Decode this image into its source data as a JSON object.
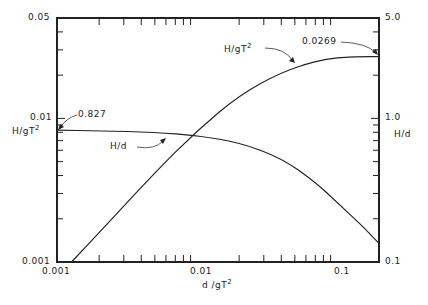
{
  "chart_data": {
    "type": "line",
    "title": "",
    "xlabel": "d/gT²",
    "ylabel_left": "H/gT²",
    "ylabel_right": "H/d",
    "xscale": "log",
    "yscale_left": "log",
    "yscale_right": "log",
    "xlim": [
      0.001,
      0.2
    ],
    "ylim_left": [
      0.001,
      0.05
    ],
    "ylim_right": [
      0.1,
      5.0
    ],
    "x_ticks": [
      "0.001",
      "0.01",
      "0.1"
    ],
    "y_left_ticks": [
      "0.001",
      "0.01",
      "0.05"
    ],
    "y_right_ticks": [
      "0.1",
      "1.0",
      "5.0"
    ],
    "grid": false,
    "series": [
      {
        "name": "H/gT²",
        "axis": "left",
        "x": [
          0.00127,
          0.002,
          0.005,
          0.01,
          0.02,
          0.04,
          0.07,
          0.1,
          0.15,
          0.2
        ],
        "y": [
          0.001,
          0.0016,
          0.0042,
          0.0082,
          0.0145,
          0.021,
          0.025,
          0.0265,
          0.0269,
          0.0269
        ]
      },
      {
        "name": "H/d",
        "axis": "right",
        "x": [
          0.001,
          0.002,
          0.005,
          0.01,
          0.02,
          0.04,
          0.07,
          0.1,
          0.15,
          0.2
        ],
        "y": [
          0.827,
          0.82,
          0.8,
          0.76,
          0.68,
          0.53,
          0.36,
          0.26,
          0.18,
          0.135
        ]
      }
    ],
    "annotations": [
      {
        "text": "0.827",
        "target": "H/d at d/gT² = 0.001"
      },
      {
        "text": "0.0269",
        "target": "H/gT² limit at deep water"
      },
      {
        "text": "H/gT²",
        "target": "curve label"
      },
      {
        "text": "H/d",
        "target": "curve label"
      }
    ]
  },
  "labels": {
    "y_left_top": "0.05",
    "y_left_mid": "0.01",
    "y_left_bottom": "0.001",
    "y_left_axis": "H/gT",
    "y_left_axis_sup": "2",
    "y_right_top": "5.0",
    "y_right_mid": "1.0",
    "y_right_bottom": "0.1",
    "y_right_axis": "H/d",
    "x_left": "0.001",
    "x_mid": "0.01",
    "x_right": "0.1",
    "x_axis": "d /gT",
    "x_axis_sup": "2",
    "ann_0827": "0.827",
    "ann_0269": "0.0269",
    "curve_hgt": "H/gT",
    "curve_hgt_sup": "2",
    "curve_hd": "H/d"
  }
}
